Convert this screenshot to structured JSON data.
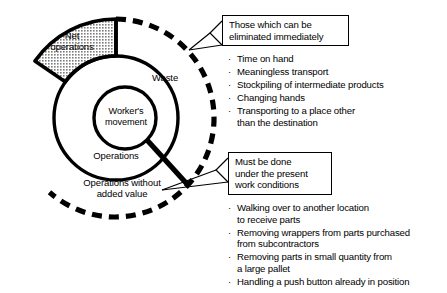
{
  "diagram": {
    "type": "concentric-circle-breakdown",
    "center_label": "Worker's\nmovement",
    "ring_labels": {
      "net_operations": "Net\noperations",
      "operations": "Operations",
      "operations_without_added_value": "Operations without\nadded value",
      "waste": "Waste"
    },
    "colors": {
      "stroke": "#000000",
      "shaded_fill": "#b3b3b3",
      "background": "#ffffff"
    }
  },
  "callouts": [
    {
      "id": "eliminated-immediately",
      "title_lines": [
        "Those which can be",
        "eliminated immediately"
      ],
      "items": [
        "Time on hand",
        "Meaningless transport",
        "Stockpiling of intermediate products",
        "Changing hands",
        "Transporting to a place other\nthan the destination"
      ]
    },
    {
      "id": "present-work-conditions",
      "title_lines": [
        "Must be done",
        "under the present",
        "work conditions"
      ],
      "items": [
        "Walking over to another location\nto receive parts",
        "Removing wrappers from parts purchased\nfrom subcontractors",
        "Removing parts in small quantity from\na large pallet",
        "Handling a push button already in position"
      ]
    }
  ],
  "bullet_glyph": "·"
}
